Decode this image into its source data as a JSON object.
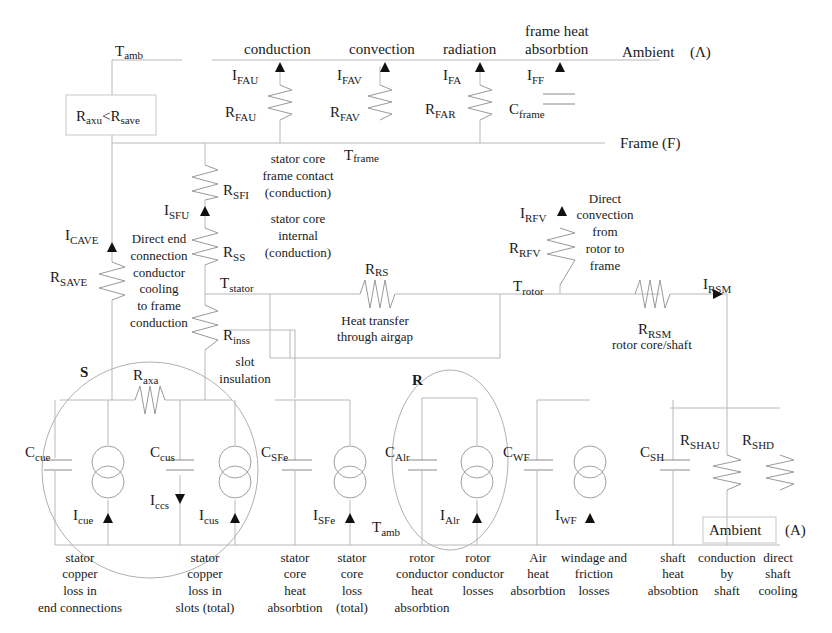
{
  "diagram": {
    "nodes": {
      "t_amb_top": {
        "main": "T",
        "sub": "amb"
      },
      "t_frame": {
        "main": "T",
        "sub": "frame"
      },
      "t_stator": {
        "main": "T",
        "sub": "stator"
      },
      "t_rotor": {
        "main": "T",
        "sub": "rotor"
      },
      "t_amb_bottom": {
        "main": "T",
        "sub": "amb"
      }
    },
    "regions": {
      "ambient_top": "Ambient",
      "ambient_top_tag": "(Λ)",
      "frame": "Frame (F)",
      "ambient_bottom": "Ambient",
      "ambient_bottom_tag": "(A)",
      "stator_group": "S",
      "rotor_group": "R"
    },
    "top_headers": {
      "conduction": "conduction",
      "convection": "convection",
      "radiation": "radiation",
      "frame_heat_1": "frame heat",
      "frame_heat_2": "absorbtion"
    },
    "box_label": {
      "a": "R",
      "a_sub": "axu",
      "lt": "<",
      "b": "R",
      "b_sub": "save"
    },
    "components": {
      "I_FAU": {
        "main": "I",
        "sub": "FAU"
      },
      "R_FAU": {
        "main": "R",
        "sub": "FAU"
      },
      "I_FAV": {
        "main": "I",
        "sub": "FAV"
      },
      "R_FAV": {
        "main": "R",
        "sub": "FAV"
      },
      "I_FA": {
        "main": "I",
        "sub": "FA"
      },
      "R_FAR": {
        "main": "R",
        "sub": "FAR"
      },
      "I_FF": {
        "main": "I",
        "sub": "FF"
      },
      "C_frame": {
        "main": "C",
        "sub": "frame"
      },
      "R_SFI": {
        "main": "R",
        "sub": "SFI"
      },
      "I_SFU": {
        "main": "I",
        "sub": "SFU"
      },
      "R_SS": {
        "main": "R",
        "sub": "SS"
      },
      "I_CAVE": {
        "main": "I",
        "sub": "CAVE"
      },
      "R_SAVE": {
        "main": "R",
        "sub": "SAVE"
      },
      "R_inss": {
        "main": "R",
        "sub": "inss"
      },
      "R_RS": {
        "main": "R",
        "sub": "RS"
      },
      "I_RFV": {
        "main": "I",
        "sub": "RFV"
      },
      "R_RFV": {
        "main": "R",
        "sub": "RFV"
      },
      "I_RSM": {
        "main": "I",
        "sub": "RSM"
      },
      "R_RSM": {
        "main": "R",
        "sub": "RSM"
      },
      "R_axa": {
        "main": "R",
        "sub": "axa"
      },
      "C_cue": {
        "main": "C",
        "sub": "cue"
      },
      "C_cus": {
        "main": "C",
        "sub": "cus"
      },
      "I_ccs": {
        "main": "I",
        "sub": "ccs"
      },
      "I_cue": {
        "main": "I",
        "sub": "cue"
      },
      "I_cus": {
        "main": "I",
        "sub": "cus"
      },
      "C_SFe": {
        "main": "C",
        "sub": "SFe"
      },
      "I_SFe": {
        "main": "I",
        "sub": "SFe"
      },
      "C_Alr": {
        "main": "C",
        "sub": "Alr"
      },
      "I_Alr": {
        "main": "I",
        "sub": "Alr"
      },
      "C_WF": {
        "main": "C",
        "sub": "WF"
      },
      "I_WF": {
        "main": "I",
        "sub": "WF"
      },
      "C_SH": {
        "main": "C",
        "sub": "SH"
      },
      "R_SHAU": {
        "main": "R",
        "sub": "SHAU"
      },
      "R_SHD": {
        "main": "R",
        "sub": "SHD"
      }
    },
    "annotations": {
      "stator_core_frame": [
        "stator core",
        "frame contact",
        "(conduction)"
      ],
      "stator_core_internal": [
        "stator core",
        "internal",
        "(conduction)"
      ],
      "direct_end": [
        "Direct end",
        "connection",
        "conductor",
        "cooling",
        "to frame",
        "conduction"
      ],
      "airgap": [
        "Heat transfer",
        "through airgap"
      ],
      "rotor_frame": [
        "Direct",
        "convection",
        "from",
        "rotor to",
        "frame"
      ],
      "rotor_shaft": "rotor core/shaft",
      "slot_insulation": [
        "slot",
        "insulation"
      ]
    },
    "bottom_captions": [
      {
        "id": "c1",
        "lines": [
          "stator",
          "copper",
          "loss in",
          "end connections"
        ]
      },
      {
        "id": "c2",
        "lines": [
          "stator",
          "copper",
          "loss in",
          "slots (total)"
        ]
      },
      {
        "id": "c3",
        "lines": [
          "stator",
          "core",
          "heat",
          "absorbtion"
        ]
      },
      {
        "id": "c4",
        "lines": [
          "stator",
          "core",
          "loss",
          "(total)"
        ]
      },
      {
        "id": "c5",
        "lines": [
          "rotor",
          "conductor",
          "heat",
          "absorbtion"
        ]
      },
      {
        "id": "c6",
        "lines": [
          "rotor",
          "conductor",
          "losses"
        ]
      },
      {
        "id": "c7",
        "lines": [
          "Air",
          "heat",
          "absorbtion"
        ]
      },
      {
        "id": "c8",
        "lines": [
          "windage and",
          "friction",
          "losses"
        ]
      },
      {
        "id": "c9",
        "lines": [
          "shaft",
          "heat",
          "absobtion"
        ]
      },
      {
        "id": "c10",
        "lines": [
          "conduction",
          "by",
          "shaft"
        ]
      },
      {
        "id": "c11",
        "lines": [
          "direct",
          "shaft",
          "cooling"
        ]
      }
    ]
  }
}
